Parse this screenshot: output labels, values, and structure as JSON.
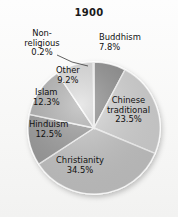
{
  "chart_data": {
    "type": "pie",
    "title": "1900",
    "xlabel": "",
    "ylabel": "",
    "legend_position": "none",
    "grid": false,
    "units": "percent",
    "categories": [
      "Buddhism",
      "Chinese traditional",
      "Christianity",
      "Hinduism",
      "Islam",
      "Other",
      "Non-religious"
    ],
    "values": [
      7.8,
      23.5,
      34.5,
      12.5,
      12.3,
      9.2,
      0.2
    ],
    "labels": [
      {
        "name": "Buddhism",
        "value": 7.8,
        "text": "Buddhism",
        "pct": "7.8%",
        "color": "#8f8f8f",
        "placement": "outside-top-right"
      },
      {
        "name": "Chinese traditional",
        "value": 23.5,
        "text": "Chinese\ntraditional",
        "pct": "23.5%",
        "color": "#d8d8d8",
        "placement": "inside"
      },
      {
        "name": "Christianity",
        "value": 34.5,
        "text": "Christianity",
        "pct": "34.5%",
        "color": "#c9c9c9",
        "placement": "inside"
      },
      {
        "name": "Hinduism",
        "value": 12.5,
        "text": "Hinduism",
        "pct": "12.5%",
        "color": "#9e9e9e",
        "placement": "inside"
      },
      {
        "name": "Islam",
        "value": 12.3,
        "text": "Islam",
        "pct": "12.3%",
        "color": "#b5b5b5",
        "placement": "inside"
      },
      {
        "name": "Other",
        "value": 9.2,
        "text": "Other",
        "pct": "9.2%",
        "color": "#dedede",
        "placement": "inside"
      },
      {
        "name": "Non-religious",
        "value": 0.2,
        "text": "Non-\nreligious",
        "pct": "0.2%",
        "color": "#efefef",
        "placement": "outside-leader-line"
      }
    ],
    "start_angle_deg": 0,
    "direction": "clockwise"
  },
  "title": {
    "text": "1900"
  },
  "labels": {
    "buddhism_name": "Buddhism",
    "buddhism_pct": "7.8%",
    "chinese_name_line1": "Chinese",
    "chinese_name_line2": "traditional",
    "chinese_pct": "23.5%",
    "christianity_name": "Christianity",
    "christianity_pct": "34.5%",
    "hinduism_name": "Hinduism",
    "hinduism_pct": "12.5%",
    "islam_name": "Islam",
    "islam_pct": "12.3%",
    "other_name": "Other",
    "other_pct": "9.2%",
    "nonreligious_name_line1": "Non-",
    "nonreligious_name_line2": "religious",
    "nonreligious_pct": "0.2%"
  },
  "colors": {
    "buddhism": "#8f8f8f",
    "chinese": "#d8d8d8",
    "christianity": "#c9c9c9",
    "hinduism": "#9e9e9e",
    "islam": "#b5b5b5",
    "other": "#dedede",
    "nonreligious": "#efefef",
    "outline": "#ffffff",
    "text": "#111111",
    "background": "#f7f7f6"
  }
}
